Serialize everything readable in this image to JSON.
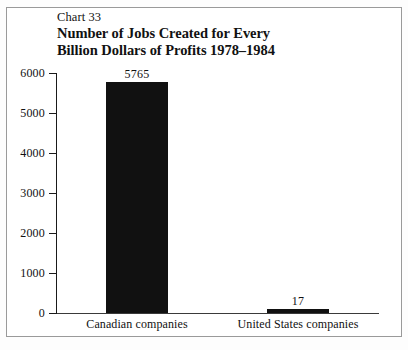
{
  "figure": {
    "chart_number_label": "Chart 33",
    "title_line_1": "Number of Jobs Created for Every",
    "title_line_2": "Billion Dollars of Profits 1978–1984",
    "frame_color": "#9a9a9a",
    "bar_color": "#111111",
    "axis_color": "#1a1a1a",
    "background": "#ffffff"
  },
  "chart_data": {
    "type": "bar",
    "title": "Number of Jobs Created for Every Billion Dollars of Profits 1978–1984",
    "subtitle": "Chart 33",
    "xlabel": "",
    "ylabel": "",
    "categories": [
      "Canadian companies",
      "United States companies"
    ],
    "values": [
      5765,
      17
    ],
    "value_labels": [
      "5765",
      "17"
    ],
    "ylim": [
      0,
      6000
    ],
    "yticks": [
      0,
      1000,
      2000,
      3000,
      4000,
      5000,
      6000
    ],
    "ytick_labels": [
      "0",
      "1000",
      "2000",
      "3000",
      "4000",
      "5000",
      "6000"
    ],
    "grid": false,
    "legend": false,
    "series": [
      {
        "name": "Jobs created per billion dollars of profits",
        "values": [
          5765,
          17
        ]
      }
    ]
  }
}
